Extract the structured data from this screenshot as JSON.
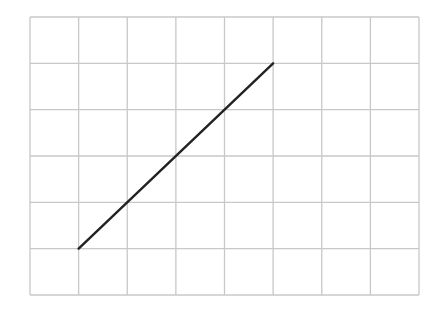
{
  "diagram": {
    "type": "grid-with-line-segment",
    "grid": {
      "columns": 8,
      "rows": 6,
      "left": 30,
      "top": 17,
      "right": 419,
      "bottom": 295,
      "line_color": "#c8c8c8",
      "line_width": 1.3
    },
    "segment": {
      "from": {
        "col": 1,
        "row_from_bottom": 1
      },
      "to": {
        "col": 5,
        "row_from_bottom": 5
      },
      "color": "#222222",
      "width": 2.4
    }
  }
}
